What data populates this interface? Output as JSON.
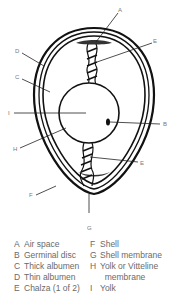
{
  "diagram": {
    "callouts": [
      {
        "key": "A",
        "x": 118,
        "y": 9
      },
      {
        "key": "E",
        "x": 153,
        "y": 40
      },
      {
        "key": "D",
        "x": 15,
        "y": 50
      },
      {
        "key": "C",
        "x": 15,
        "y": 76
      },
      {
        "key": "I",
        "x": 8,
        "y": 110
      },
      {
        "key": "B",
        "x": 163,
        "y": 123
      },
      {
        "key": "H",
        "x": 13,
        "y": 146
      },
      {
        "key": "E",
        "x": 140,
        "y": 161
      },
      {
        "key": "F",
        "x": 29,
        "y": 193
      },
      {
        "key": "G",
        "x": 87,
        "y": 226
      }
    ]
  },
  "legend": {
    "rows": [
      {
        "left_key": "A",
        "left_text": "Air space",
        "right_key": "F",
        "right_text": "Shell"
      },
      {
        "left_key": "B",
        "left_text": "Germinal disc",
        "right_key": "G",
        "right_text": "Shell membrane"
      },
      {
        "left_key": "C",
        "left_text": "Thick albumen",
        "right_key": "H",
        "right_text": "Yolk or Vitteline"
      },
      {
        "left_key": "D",
        "left_text": "Thin albumen",
        "right_key": "",
        "right_text": "  membrane"
      },
      {
        "left_key": "E",
        "left_text": "Chalza (1 of 2)",
        "right_key": "I",
        "right_text": "Yolk"
      }
    ]
  }
}
